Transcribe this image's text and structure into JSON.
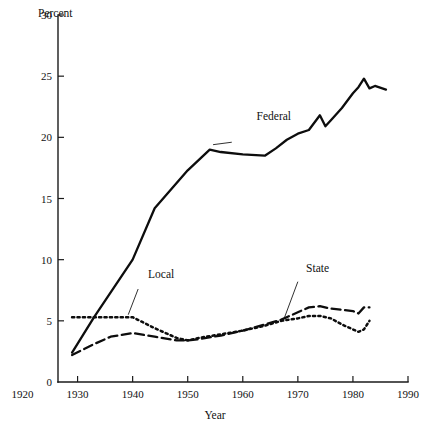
{
  "chart_data": {
    "type": "line",
    "title": "",
    "subtitle": "",
    "xlabel": "Year",
    "ylabel": "Percent",
    "xlim": [
      1920,
      1990
    ],
    "ylim": [
      0,
      30
    ],
    "grid": false,
    "legend_position": "inline-annotations",
    "x_ticks": [
      1920,
      1930,
      1940,
      1950,
      1960,
      1970,
      1980,
      1990
    ],
    "x_tick_labels": [
      "1920",
      "1930",
      "1940",
      "1950",
      "1960",
      "1970",
      "1980",
      "1990"
    ],
    "y_ticks": [
      0,
      5,
      10,
      15,
      20,
      25,
      30
    ],
    "y_tick_labels": [
      "0",
      "5",
      "10",
      "15",
      "20",
      "25",
      "30"
    ],
    "annotations": [
      {
        "text": "Federal",
        "x": 1962.5,
        "y": 21.4
      },
      {
        "text": "Local",
        "x": 1942.8,
        "y": 8.5
      },
      {
        "text": "State",
        "x": 1971.5,
        "y": 9.0
      }
    ],
    "series": [
      {
        "name": "Federal",
        "style": "solid",
        "x": [
          1929,
          1933,
          1940,
          1944,
          1950,
          1954,
          1956,
          1960,
          1964,
          1966,
          1968,
          1970,
          1972,
          1974,
          1975,
          1976,
          1978,
          1980,
          1981,
          1982,
          1983,
          1984,
          1986
        ],
        "values": [
          2.4,
          5.3,
          10.0,
          14.2,
          17.3,
          19.0,
          18.8,
          18.6,
          18.5,
          19.1,
          19.8,
          20.3,
          20.6,
          21.8,
          20.9,
          21.4,
          22.4,
          23.6,
          24.1,
          24.8,
          24.0,
          24.2,
          23.9
        ]
      },
      {
        "name": "Local",
        "style": "dotted",
        "x": [
          1929,
          1933,
          1936,
          1940,
          1944,
          1948,
          1950,
          1952,
          1956,
          1960,
          1964,
          1967,
          1970,
          1972,
          1974,
          1976,
          1978,
          1980,
          1981,
          1982,
          1983
        ],
        "values": [
          5.3,
          5.3,
          5.3,
          5.3,
          4.4,
          3.6,
          3.4,
          3.6,
          3.9,
          4.2,
          4.6,
          5.0,
          5.2,
          5.4,
          5.4,
          5.2,
          4.7,
          4.3,
          4.1,
          4.3,
          5.0
        ]
      },
      {
        "name": "State",
        "style": "dashed",
        "x": [
          1929,
          1933,
          1936,
          1940,
          1944,
          1948,
          1950,
          1952,
          1956,
          1960,
          1964,
          1967,
          1970,
          1972,
          1974,
          1976,
          1978,
          1980,
          1981,
          1982,
          1983
        ],
        "values": [
          2.2,
          3.1,
          3.7,
          4.0,
          3.7,
          3.4,
          3.4,
          3.5,
          3.8,
          4.2,
          4.7,
          5.1,
          5.7,
          6.1,
          6.2,
          6.0,
          5.9,
          5.8,
          5.6,
          6.1,
          6.1
        ]
      }
    ]
  },
  "colors": {
    "axis": "#1a1a1a",
    "line": "#0d0d0d",
    "background": "#ffffff"
  }
}
